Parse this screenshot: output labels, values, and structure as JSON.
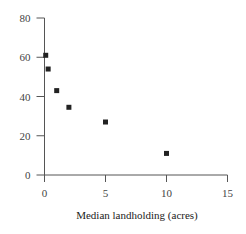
{
  "chart_data": {
    "type": "scatter",
    "title": "",
    "xlabel": "Median landholding (acres)",
    "ylabel": "",
    "xlim": [
      0,
      15
    ],
    "ylim": [
      0,
      80
    ],
    "xticks": [
      0,
      5,
      10,
      15
    ],
    "yticks": [
      0,
      20,
      40,
      60,
      80
    ],
    "grid": false,
    "legend": null,
    "series": [
      {
        "name": "points",
        "marker": "square",
        "color": "#222222",
        "x": [
          0.1,
          0.3,
          1,
          2,
          5,
          10
        ],
        "y": [
          61,
          54,
          43,
          34.5,
          27,
          11
        ]
      }
    ]
  },
  "layout": {
    "plot_left": 44.5,
    "plot_bottom": 175,
    "px_per_x": 12.2,
    "px_per_y": 1.9625,
    "axis_color": "#555555"
  }
}
